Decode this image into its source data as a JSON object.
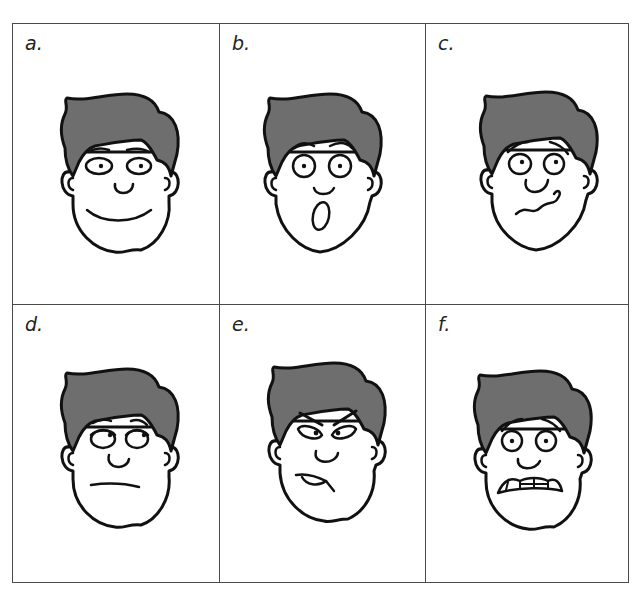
{
  "figure": {
    "panels": [
      {
        "label": "a.",
        "expression": "happy",
        "icon": "smiling-face-icon"
      },
      {
        "label": "b.",
        "expression": "surprised",
        "icon": "surprised-face-icon"
      },
      {
        "label": "c.",
        "expression": "confused",
        "icon": "confused-face-icon"
      },
      {
        "label": "d.",
        "expression": "bored",
        "icon": "bored-face-icon"
      },
      {
        "label": "e.",
        "expression": "angry",
        "icon": "angry-face-icon"
      },
      {
        "label": "f.",
        "expression": "scared",
        "icon": "scared-face-icon"
      }
    ],
    "colors": {
      "hair": "#6e6e6e",
      "outline": "#111111",
      "border": "#4a4a4a",
      "background": "#ffffff"
    }
  }
}
